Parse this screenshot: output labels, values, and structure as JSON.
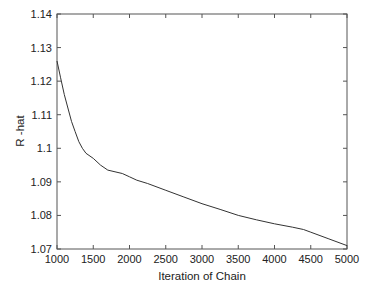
{
  "chart_data": {
    "type": "line",
    "title": "",
    "xlabel": "Iteration of Chain",
    "ylabel": "R -hat",
    "xlim": [
      1000,
      5000
    ],
    "ylim": [
      1.07,
      1.14
    ],
    "xticks": [
      "1000",
      "1500",
      "2000",
      "2500",
      "3000",
      "3500",
      "4000",
      "4500",
      "5000"
    ],
    "yticks": [
      "1.07",
      "1.08",
      "1.09",
      "1.1",
      "1.11",
      "1.12",
      "1.13",
      "1.14"
    ],
    "grid": false,
    "legend": null,
    "series": [
      {
        "name": "R-hat",
        "color": "#333333",
        "x": [
          1000,
          1050,
          1100,
          1150,
          1200,
          1250,
          1300,
          1350,
          1400,
          1500,
          1600,
          1700,
          1800,
          1900,
          2000,
          2100,
          2250,
          2500,
          2750,
          3000,
          3250,
          3500,
          3750,
          4000,
          4250,
          4400,
          4500,
          4750,
          5000
        ],
        "values": [
          1.126,
          1.121,
          1.116,
          1.112,
          1.108,
          1.105,
          1.102,
          1.1,
          1.0985,
          1.097,
          1.095,
          1.0935,
          1.093,
          1.0925,
          1.0915,
          1.0905,
          1.0895,
          1.0875,
          1.0855,
          1.0835,
          1.0818,
          1.08,
          1.0787,
          1.0775,
          1.0765,
          1.0758,
          1.075,
          1.073,
          1.071
        ]
      }
    ]
  }
}
